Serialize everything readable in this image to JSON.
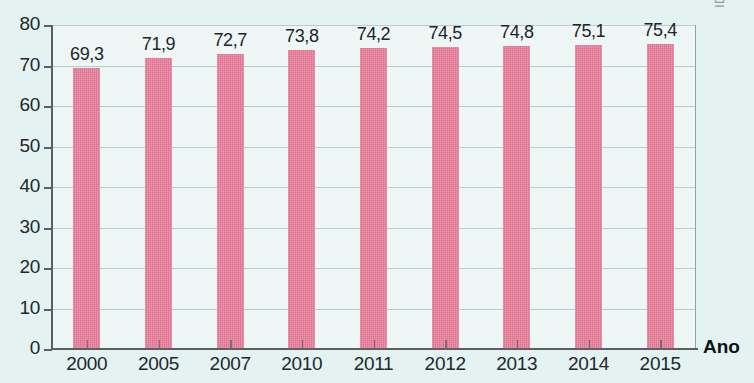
{
  "chart_data": {
    "type": "bar",
    "title": "",
    "xlabel": "Ano",
    "ylabel": "",
    "categories": [
      "2000",
      "2005",
      "2007",
      "2010",
      "2011",
      "2012",
      "2013",
      "2014",
      "2015"
    ],
    "values": [
      69.3,
      71.9,
      72.7,
      73.8,
      74.2,
      74.5,
      74.8,
      75.1,
      75.4
    ],
    "value_labels": [
      "69,3",
      "71,9",
      "72,7",
      "73,8",
      "74,2",
      "74,5",
      "74,8",
      "75,1",
      "75,4"
    ],
    "ylim": [
      0,
      80
    ],
    "ytick_labels": [
      "80",
      "70",
      "60",
      "50",
      "40",
      "30",
      "20",
      "10",
      "0"
    ],
    "ytick_values": [
      80,
      70,
      60,
      50,
      40,
      30,
      20,
      10,
      0
    ],
    "grid": true,
    "legend": null,
    "series": [
      {
        "name": "",
        "values": [
          69.3,
          71.9,
          72.7,
          73.8,
          74.2,
          74.5,
          74.8,
          75.1,
          75.4
        ]
      }
    ],
    "annotations": {
      "watermark": "ID/BR"
    },
    "colors": {
      "bar": "#e0718f",
      "background": "#e4f3f1",
      "plot_background": "#eef7f6",
      "gridline": "#b9cccb",
      "axis": "#5a5f60",
      "text": "#20282b",
      "watermark": "#8d9a9c"
    }
  }
}
